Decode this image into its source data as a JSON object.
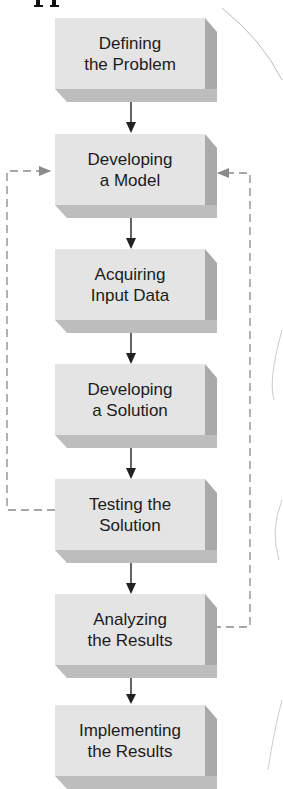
{
  "diagram": {
    "type": "flowchart",
    "steps": [
      {
        "line1": "Defining",
        "line2": "the Problem"
      },
      {
        "line1": "Developing",
        "line2": "a Model"
      },
      {
        "line1": "Acquiring",
        "line2": "Input Data"
      },
      {
        "line1": "Developing",
        "line2": "a Solution"
      },
      {
        "line1": "Testing the",
        "line2": "Solution"
      },
      {
        "line1": "Analyzing",
        "line2": "the Results"
      },
      {
        "line1": "Implementing",
        "line2": "the Results"
      }
    ],
    "feedback_loops": [
      {
        "from": "Testing the Solution",
        "to": "Developing a Model",
        "side": "left",
        "style": "dashed"
      },
      {
        "from": "Analyzing the Results",
        "to": "Developing a Model",
        "side": "right",
        "style": "dashed"
      }
    ],
    "colors": {
      "box_front": "#e4e4e4",
      "box_side": "#a9a9a9",
      "box_bottom": "#bdbdbd",
      "arrow": "#222222",
      "dashed": "#8a8a8a"
    }
  }
}
